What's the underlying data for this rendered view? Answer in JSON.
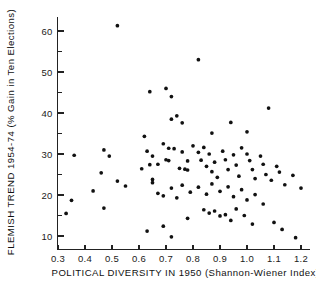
{
  "chart_data": {
    "type": "scatter",
    "title": "",
    "xlabel": "POLITICAL DIVERSITY IN 1950 (Shannon-Wiener Index)",
    "ylabel": "FLEMISH TREND 1954-74 (% Gain in Ten Elections)",
    "xlim": [
      0.26,
      1.245
    ],
    "ylim": [
      8.0,
      63.5
    ],
    "xticks": [
      0.3,
      0.4,
      0.5,
      0.6,
      0.7,
      0.8,
      0.9,
      1.0,
      1.1,
      1.2
    ],
    "xticklabels": [
      "0.3",
      "0.4",
      "0.5",
      "0.6",
      "0.7",
      "0.8",
      "0.9",
      "1.0",
      "1.1",
      "1.2"
    ],
    "yticks": [
      10,
      20,
      30,
      40,
      50,
      60
    ],
    "yticklabels": [
      "10",
      "20",
      "30",
      "40",
      "50",
      "60"
    ],
    "y_minor_ticks": [
      15,
      25,
      35,
      45,
      55
    ],
    "grid": false,
    "legend": null,
    "marker": "filled-circle",
    "marker_color": "#111111",
    "points": [
      [
        0.52,
        61.3
      ],
      [
        0.82,
        53.0
      ],
      [
        0.74,
        39.3
      ],
      [
        0.72,
        38.5
      ],
      [
        0.76,
        37.6
      ],
      [
        0.87,
        35.1
      ],
      [
        0.64,
        45.2
      ],
      [
        0.7,
        46.0
      ],
      [
        0.72,
        44.0
      ],
      [
        1.08,
        41.2
      ],
      [
        0.94,
        37.7
      ],
      [
        1.0,
        35.4
      ],
      [
        0.62,
        34.3
      ],
      [
        0.47,
        31.0
      ],
      [
        0.36,
        29.7
      ],
      [
        0.49,
        29.5
      ],
      [
        0.63,
        30.7
      ],
      [
        0.65,
        29.5
      ],
      [
        0.67,
        27.5
      ],
      [
        0.46,
        25.4
      ],
      [
        0.43,
        21.0
      ],
      [
        0.35,
        18.7
      ],
      [
        0.33,
        15.5
      ],
      [
        0.47,
        16.8
      ],
      [
        0.52,
        23.4
      ],
      [
        0.55,
        22.2
      ],
      [
        0.61,
        26.4
      ],
      [
        0.64,
        27.4
      ],
      [
        0.65,
        23.8
      ],
      [
        0.65,
        23.0
      ],
      [
        0.63,
        11.2
      ],
      [
        0.69,
        32.5
      ],
      [
        0.71,
        31.4
      ],
      [
        0.73,
        31.3
      ],
      [
        0.7,
        28.6
      ],
      [
        0.71,
        28.4
      ],
      [
        0.76,
        30.5
      ],
      [
        0.78,
        28.3
      ],
      [
        0.75,
        26.5
      ],
      [
        0.77,
        26.3
      ],
      [
        0.78,
        26.1
      ],
      [
        0.8,
        32.0
      ],
      [
        0.82,
        30.4
      ],
      [
        0.84,
        31.6
      ],
      [
        0.83,
        28.5
      ],
      [
        0.85,
        27.0
      ],
      [
        0.86,
        30.0
      ],
      [
        0.88,
        28.0
      ],
      [
        0.87,
        25.7
      ],
      [
        0.89,
        24.3
      ],
      [
        0.91,
        30.7
      ],
      [
        0.92,
        28.6
      ],
      [
        0.93,
        26.2
      ],
      [
        0.95,
        29.8
      ],
      [
        0.96,
        27.3
      ],
      [
        0.97,
        24.6
      ],
      [
        0.98,
        31.5
      ],
      [
        1.0,
        30.0
      ],
      [
        1.01,
        28.4
      ],
      [
        1.02,
        26.2
      ],
      [
        1.03,
        24.0
      ],
      [
        1.05,
        29.5
      ],
      [
        1.06,
        27.5
      ],
      [
        1.07,
        25.0
      ],
      [
        1.09,
        23.6
      ],
      [
        1.11,
        27.0
      ],
      [
        1.12,
        25.6
      ],
      [
        1.14,
        22.5
      ],
      [
        1.17,
        24.8
      ],
      [
        1.2,
        21.7
      ],
      [
        0.67,
        20.4
      ],
      [
        0.69,
        19.8
      ],
      [
        0.72,
        21.7
      ],
      [
        0.74,
        19.3
      ],
      [
        0.76,
        22.4
      ],
      [
        0.79,
        20.7
      ],
      [
        0.82,
        21.9
      ],
      [
        0.85,
        20.2
      ],
      [
        0.87,
        22.7
      ],
      [
        0.9,
        20.9
      ],
      [
        0.93,
        22.0
      ],
      [
        0.95,
        19.6
      ],
      [
        0.98,
        21.3
      ],
      [
        1.0,
        18.8
      ],
      [
        1.03,
        20.1
      ],
      [
        1.06,
        17.8
      ],
      [
        0.84,
        16.4
      ],
      [
        0.86,
        15.6
      ],
      [
        0.88,
        16.1
      ],
      [
        0.9,
        14.9
      ],
      [
        0.92,
        15.2
      ],
      [
        0.94,
        13.8
      ],
      [
        0.96,
        16.6
      ],
      [
        0.99,
        15.0
      ],
      [
        0.78,
        14.3
      ],
      [
        1.1,
        13.3
      ],
      [
        1.13,
        11.6
      ],
      [
        1.18,
        9.6
      ],
      [
        0.72,
        9.8
      ],
      [
        0.69,
        12.4
      ],
      [
        1.02,
        12.9
      ]
    ]
  }
}
